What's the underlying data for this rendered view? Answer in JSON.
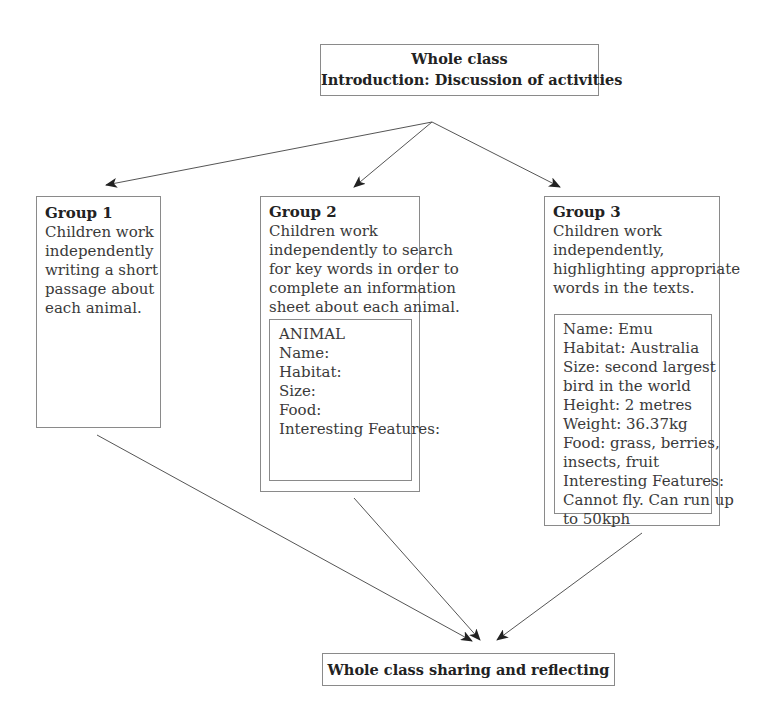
{
  "diagram": {
    "top": {
      "line1": "Whole class",
      "line2": "Introduction: Discussion of activities"
    },
    "groups": [
      {
        "title": "Group 1",
        "lines": [
          "Children work",
          "independently",
          "writing a short",
          "passage about",
          "each animal."
        ]
      },
      {
        "title": "Group 2",
        "lines": [
          "Children work",
          "independently to search",
          "for key words in order to",
          "complete an information",
          "sheet about each animal."
        ],
        "inner": [
          "ANIMAL",
          "Name:",
          "Habitat:",
          "Size:",
          "Food:",
          "Interesting Features:"
        ]
      },
      {
        "title": "Group 3",
        "lines": [
          "Children work",
          "independently,",
          "highlighting appropriate",
          "words in the texts."
        ],
        "inner": [
          "Name: Emu",
          "Habitat: Australia",
          "Size: second largest",
          "bird in the world",
          "Height: 2 metres",
          "Weight: 36.37kg",
          "Food: grass, berries,",
          "insects, fruit",
          "Interesting Features:",
          "Cannot fly. Can run up",
          "to 50kph"
        ]
      }
    ],
    "bottom": {
      "label": "Whole class sharing and reflecting"
    },
    "colors": {
      "border": "#8a8a8a",
      "arrow": "#555555",
      "text": "#3a3a3a"
    }
  }
}
